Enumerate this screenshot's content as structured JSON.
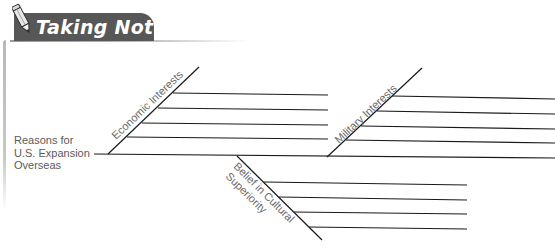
{
  "header": {
    "title": "Taking Notes",
    "icon": "pencil-icon",
    "tab_color": "#575757"
  },
  "diagram": {
    "type": "fishbone",
    "main_label_lines": [
      "Reasons for",
      "U.S. Expansion",
      "Overseas"
    ],
    "branches": [
      {
        "label": "Economic Interests",
        "position": "upper-left",
        "blank_lines": 4
      },
      {
        "label": "Military Interests",
        "position": "upper-right",
        "blank_lines": 4
      },
      {
        "label": "Belief in Cultural Superiority",
        "label_lines": [
          "Belief in Cultural",
          "Superiority"
        ],
        "position": "lower-middle",
        "blank_lines": 4
      }
    ],
    "line_color": "#1a1a1a",
    "text_color": "#6a6a6a"
  }
}
